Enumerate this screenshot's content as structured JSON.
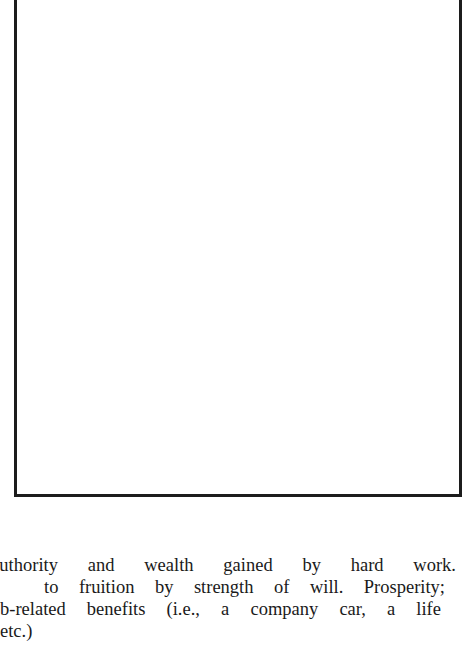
{
  "figure": {
    "frame": "empty-image-frame"
  },
  "caption": {
    "lines": [
      "Authority and wealth gained by hard work.",
      "to fruition by strength of will. Prosperity;",
      "b-related benefits (i.e., a company car, a life",
      " etc.)"
    ]
  }
}
